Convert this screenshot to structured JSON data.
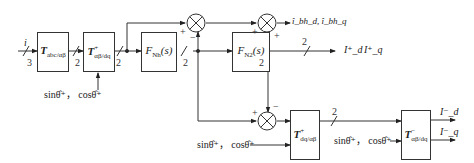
{
  "diagram": {
    "type": "block-diagram",
    "input": {
      "label": "i",
      "width": "3"
    },
    "blocks": [
      {
        "id": "abc2ab",
        "main": "T",
        "sub": "abc/αβ",
        "sup": ""
      },
      {
        "id": "ab2dq_pos",
        "main": "T",
        "sub": "αβ/dq",
        "sup": "+"
      },
      {
        "id": "fnh",
        "main": "F",
        "sub": "Nh",
        "suffix": "(s)"
      },
      {
        "id": "fn2",
        "main": "F",
        "sub": "N2",
        "suffix": "(s)"
      },
      {
        "id": "dq2ab_neg",
        "main": "T",
        "sub": "dq/αβ",
        "sup": "+"
      },
      {
        "id": "ab2dq_neg",
        "main": "T",
        "sub": "αβ/dq",
        "sup": "−"
      }
    ],
    "bus_widths": {
      "w1": "2",
      "w2": "2",
      "w3": "2",
      "w4": "2",
      "w5": "2",
      "w6": "2"
    },
    "angle_inputs": {
      "a1": "sinθ̂⁺， cosθ̂⁺",
      "a2": "sinθ̂⁺， cosθ̂⁺",
      "a3": "sinθ̂⁺， cosθ̂⁺"
    },
    "summing_signs": {
      "s1_left": "+",
      "s1_bottom": "−",
      "s2_left": "+",
      "s2_bottom": "+",
      "s3_left": "+",
      "s3_top": "−"
    },
    "outputs": {
      "harmonic": "î_bh_d, î_bh_q",
      "positive_d": "I⁺_d",
      "positive_q": "I⁺_q",
      "negative_d": "I⁻_d",
      "negative_q": "I⁻_q"
    }
  }
}
